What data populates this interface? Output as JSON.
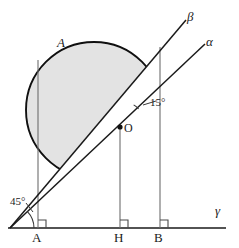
{
  "figure": {
    "type": "geometry-diagram",
    "background_color": "#ffffff",
    "stroke_color": "#1a1a1a",
    "thin_stroke_color": "#6d6d6d",
    "region_fill_color": "#e3e3e3",
    "region_stroke_color": "#101010"
  },
  "labels": {
    "point_a": "A",
    "point_h": "H",
    "point_b": "B",
    "center_o": "O",
    "region_a": "A",
    "line_alpha": "α",
    "line_beta": "β",
    "line_gamma": "γ",
    "angle_45": "45°",
    "angle_15": "15°"
  },
  "geometry": {
    "baseline": {
      "x1": 8,
      "y1": 228,
      "x2": 226,
      "y2": 228
    },
    "origin": {
      "x": 10,
      "y": 228
    },
    "vertical_a": {
      "x": 38,
      "y_top": 60,
      "y_bottom": 228
    },
    "vertical_h": {
      "x": 120,
      "y_top": 127,
      "y_bottom": 228
    },
    "vertical_b": {
      "x": 160,
      "y_top": 47,
      "y_bottom": 228
    },
    "ray_alpha": {
      "x1": 10,
      "y1": 228,
      "x2": 205,
      "y2": 44
    },
    "ray_beta": {
      "x1": 10,
      "y1": 228,
      "x2": 186,
      "y2": 20
    },
    "point_o": {
      "x": 120,
      "y": 127,
      "radius": 2.6
    },
    "square_size": 8,
    "angle_45_arc_radius": 24,
    "angle_15_arc_radius": 26,
    "region_arc_start": {
      "x": 60,
      "y": 172
    },
    "region_arc_end": {
      "x": 157,
      "y": 48
    },
    "region_circle_center": {
      "x": 94,
      "y": 110
    },
    "region_circle_radius": 68
  },
  "label_positions": {
    "point_a": {
      "x": 32,
      "y": 231
    },
    "point_h": {
      "x": 114,
      "y": 231
    },
    "point_b": {
      "x": 154,
      "y": 231
    },
    "center_o": {
      "x": 124,
      "y": 122
    },
    "region_a": {
      "x": 57,
      "y": 36
    },
    "line_alpha": {
      "x": 206,
      "y": 35
    },
    "line_beta": {
      "x": 187,
      "y": 10
    },
    "line_gamma": {
      "x": 215,
      "y": 204
    },
    "angle_45": {
      "x": 10,
      "y": 196
    },
    "angle_15": {
      "x": 150,
      "y": 97
    }
  },
  "annotations": {
    "right_angle_marks": [
      "A",
      "H",
      "B"
    ],
    "angle_marks": [
      "45° at baseline vertex",
      "15° between α and β at O"
    ]
  }
}
